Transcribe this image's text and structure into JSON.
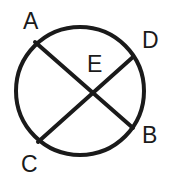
{
  "figure": {
    "kind": "geometry-diagram",
    "canvas": {
      "width": 172,
      "height": 190
    },
    "colors": {
      "background": "#ffffff",
      "stroke": "#1a1a1a",
      "label": "#1a1a1a"
    },
    "stroke_width": 4,
    "circle": {
      "cx": 80,
      "cy": 91,
      "r": 64
    },
    "chords": [
      {
        "name": "chord-AB",
        "from": "A",
        "to": "B",
        "x1": 35,
        "y1": 42,
        "x2": 133,
        "y2": 128
      },
      {
        "name": "chord-CD",
        "from": "C",
        "to": "D",
        "x1": 38,
        "y1": 142,
        "x2": 133,
        "y2": 57
      }
    ],
    "intersection": {
      "name": "E",
      "x": 88,
      "y": 97
    },
    "labels": [
      {
        "id": "A",
        "text": "A",
        "position": "outside-top-left"
      },
      {
        "id": "D",
        "text": "D",
        "position": "outside-upper-right"
      },
      {
        "id": "E",
        "text": "E",
        "position": "inside-center"
      },
      {
        "id": "B",
        "text": "B",
        "position": "outside-lower-right"
      },
      {
        "id": "C",
        "text": "C",
        "position": "outside-bottom-left"
      }
    ]
  }
}
